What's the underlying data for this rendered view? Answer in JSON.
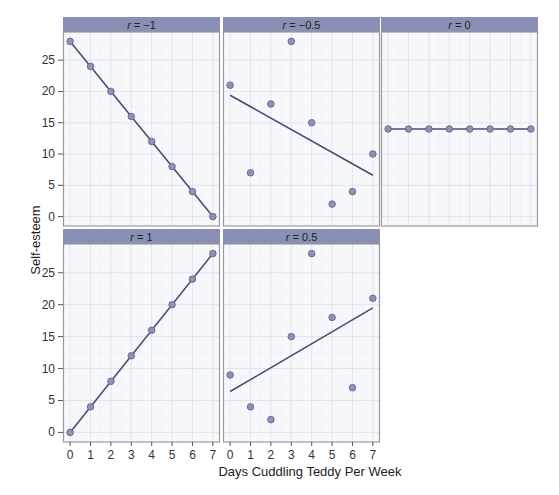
{
  "chart_data": {
    "type": "scatter",
    "layout": "facet-grid",
    "xlabel": "Days Cuddling Teddy Per Week",
    "ylabel": "Self-esteem",
    "x_ticks": [
      0,
      1,
      2,
      3,
      4,
      5,
      6,
      7
    ],
    "y_ticks": [
      0,
      5,
      10,
      15,
      20,
      25
    ],
    "xlim": [
      -0.35,
      7.35
    ],
    "ylim": [
      -1.5,
      29.5
    ],
    "grid": true,
    "colors": {
      "strip": "#8a8fb5",
      "panel_bg": "#f7f8fc",
      "grid_major": "#e2e4ee",
      "grid_minor": "#eef0f6",
      "border": "#9a9a9a",
      "point_fill": "#8e92b8",
      "point_stroke": "#5a5e85",
      "line": "#4a4d72"
    },
    "panels": [
      {
        "label_var": "r",
        "label_rest": " = −1",
        "row": 0,
        "col": 0,
        "x": [
          0,
          1,
          2,
          3,
          4,
          5,
          6,
          7
        ],
        "y": [
          28,
          24,
          20,
          16,
          12,
          8,
          4,
          0
        ],
        "fit": [
          28,
          0
        ]
      },
      {
        "label_var": "r",
        "label_rest": " = −0.5",
        "row": 0,
        "col": 1,
        "x": [
          0,
          1,
          2,
          3,
          4,
          5,
          6,
          7
        ],
        "y": [
          21,
          7,
          18,
          28,
          15,
          2,
          4,
          10
        ],
        "fit": [
          19.4,
          6.6
        ]
      },
      {
        "label_var": "r",
        "label_rest": " = 0",
        "row": 0,
        "col": 2,
        "x": [
          0,
          1,
          2,
          3,
          4,
          5,
          6,
          7
        ],
        "y": [
          14,
          14,
          14,
          14,
          14,
          14,
          14,
          14
        ],
        "fit": [
          14,
          14
        ]
      },
      {
        "label_var": "r",
        "label_rest": " = 1",
        "row": 1,
        "col": 0,
        "x": [
          0,
          1,
          2,
          3,
          4,
          5,
          6,
          7
        ],
        "y": [
          0,
          4,
          8,
          12,
          16,
          20,
          24,
          28
        ],
        "fit": [
          0,
          28
        ]
      },
      {
        "label_var": "r",
        "label_rest": " = 0.5",
        "row": 1,
        "col": 1,
        "x": [
          0,
          1,
          2,
          3,
          4,
          5,
          6,
          7
        ],
        "y": [
          9,
          4,
          2,
          15,
          28,
          18,
          7,
          21
        ],
        "fit": [
          6.4,
          19.5
        ]
      }
    ]
  }
}
